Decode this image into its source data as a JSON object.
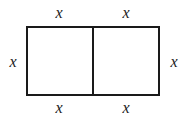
{
  "figure": {
    "type": "geometry-diagram",
    "background_color": "#ffffff",
    "stroke_color": "#1a1a1a",
    "stroke_width_px": 2,
    "shape": {
      "name": "rectangle",
      "left_px": 26,
      "top_px": 26,
      "width_px": 134,
      "height_px": 70,
      "divider": {
        "name": "vertical-divider",
        "orientation": "vertical",
        "x_px": 93
      }
    },
    "labels": {
      "top_left": "x",
      "top_right": "x",
      "bottom_left": "x",
      "bottom_right": "x",
      "left": "x",
      "right": "x"
    }
  }
}
